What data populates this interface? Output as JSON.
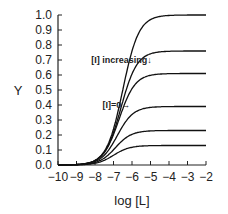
{
  "chart_data": {
    "type": "line",
    "title": "",
    "xlabel": "log [L]",
    "ylabel": "Y",
    "xlim": [
      -10,
      -2
    ],
    "ylim": [
      0.0,
      1.0
    ],
    "grid": false,
    "legend": null,
    "x_ticks": [
      "-10",
      "-9",
      "-8",
      "-7",
      "-6",
      "-5",
      "-4",
      "-3",
      "-2"
    ],
    "y_ticks": [
      "0.0",
      "0.1",
      "0.2",
      "0.3",
      "0.4",
      "0.5",
      "0.6",
      "0.7",
      "0.8",
      "0.9",
      "1.0"
    ],
    "annotations": [
      {
        "text": "[I] increasing↓",
        "x": -8.2,
        "y": 0.68
      },
      {
        "text": "[I]=0→",
        "x": -7.6,
        "y": 0.38
      }
    ],
    "series": [
      {
        "name": "[I]=0",
        "plateau": 1.0,
        "midpoint": -6.5
      },
      {
        "name": "curve 2",
        "plateau": 0.76,
        "midpoint": -6.6
      },
      {
        "name": "curve 3",
        "plateau": 0.61,
        "midpoint": -6.7
      },
      {
        "name": "curve 4",
        "plateau": 0.39,
        "midpoint": -6.8
      },
      {
        "name": "curve 5",
        "plateau": 0.23,
        "midpoint": -6.9
      },
      {
        "name": "curve 6",
        "plateau": 0.13,
        "midpoint": -7.0
      }
    ]
  }
}
